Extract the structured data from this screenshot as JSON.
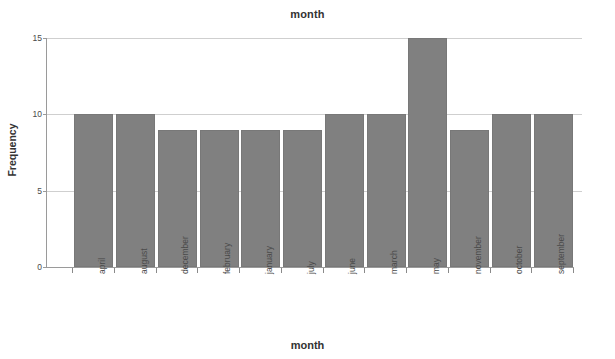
{
  "chart_data": {
    "type": "bar",
    "title": "month",
    "xlabel": "month",
    "ylabel": "Frequency",
    "categories": [
      "april",
      "august",
      "december",
      "february",
      "january",
      "july",
      "june",
      "march",
      "may",
      "november",
      "october",
      "september"
    ],
    "values": [
      10,
      10,
      9,
      9,
      9,
      9,
      10,
      10,
      15,
      9,
      10,
      10
    ],
    "ylim": [
      0,
      15
    ],
    "yticks": [
      0,
      5,
      10,
      15
    ],
    "ytick_labels": [
      "0",
      "5",
      "10",
      "15"
    ],
    "grid": true,
    "legend": "none",
    "bar_color": "#808080",
    "grid_color": "#cfcfcf",
    "axis_color": "#9a9a9a",
    "background": "#ffffff"
  }
}
